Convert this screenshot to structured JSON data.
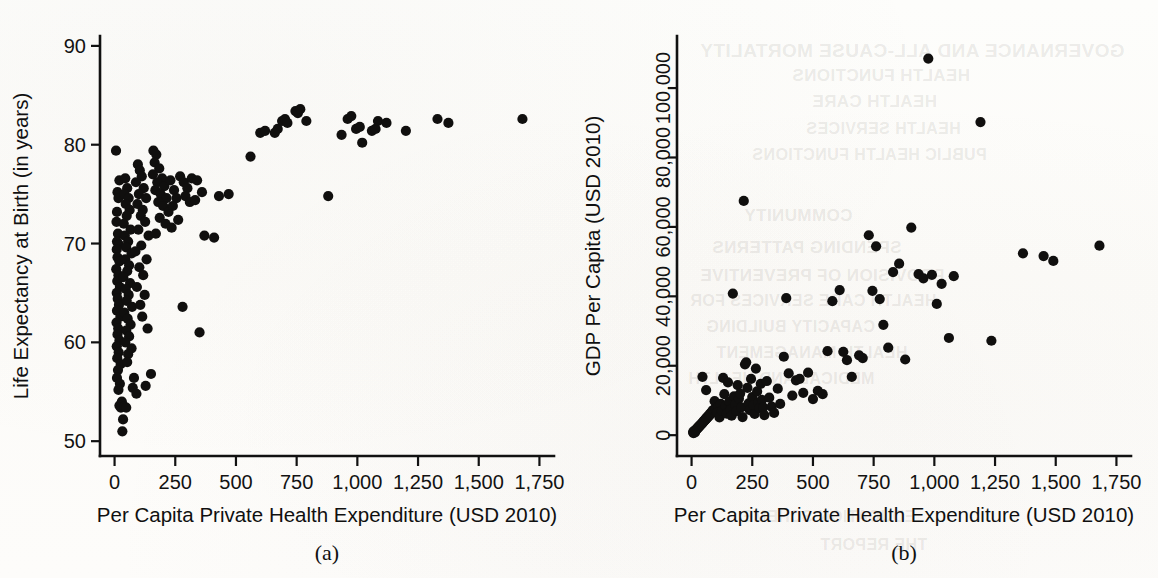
{
  "figure": {
    "background_color": "#fdfdfb",
    "ink_color": "#111111",
    "point_color": "#100f0e"
  },
  "panels": [
    {
      "id": "a",
      "caption": "(a)",
      "xlabel": "Per Capita Private Health Expenditure (USD 2010)",
      "ylabel": "Life Expectancy at Birth (in years)"
    },
    {
      "id": "b",
      "caption": "(b)",
      "xlabel": "Per Capita Private Health Expenditure (USD 2010)",
      "ylabel": "GDP Per Capita (USD 2010)"
    }
  ],
  "bleed_through_text": [
    "GOVERNANCE AND ALL-CAUSE MORTALITY",
    "HEALTH FUNCTIONS",
    "HEALTH CARE",
    "HEALTH SERVICES",
    "PUBLIC HEALTH FUNCTIONS",
    "COMMUNITY",
    "SPENDING PATTERNS",
    "PROVISION OF PREVENTIVE",
    "HEALTH CARE SERVICES FOR",
    "CAPACITY BUILDING",
    "HEALTH MANAGEMENT",
    "MEDICAL AND HEALTH",
    "EDUCATION SCHEME",
    "THE REPORT"
  ],
  "chart_data": [
    {
      "type": "scatter",
      "panel": "a",
      "title": "",
      "xlabel": "Per Capita Private Health Expenditure (USD 2010)",
      "ylabel": "Life Expectancy at Birth (in years)",
      "xlim": [
        -60,
        1810
      ],
      "ylim": [
        48.5,
        91
      ],
      "xticks": [
        0,
        250,
        500,
        750,
        1000,
        1250,
        1500,
        1750
      ],
      "xticklabels": [
        "0",
        "250",
        "500",
        "750",
        "1,000",
        "1,250",
        "1,500",
        "1,750"
      ],
      "yticks": [
        50,
        60,
        70,
        80,
        90
      ],
      "yticklabels": [
        "50",
        "60",
        "70",
        "80",
        "90"
      ],
      "grid": false,
      "legend": null,
      "marker": "filled-circle",
      "points": [
        [
          6,
          79.4
        ],
        [
          20,
          76.4
        ],
        [
          12,
          75.2
        ],
        [
          16,
          74.6
        ],
        [
          10,
          73.2
        ],
        [
          8,
          72.2
        ],
        [
          14,
          71.0
        ],
        [
          10,
          70.2
        ],
        [
          18,
          69.9
        ],
        [
          9,
          69.4
        ],
        [
          12,
          68.6
        ],
        [
          20,
          68.2
        ],
        [
          7,
          67.4
        ],
        [
          16,
          66.8
        ],
        [
          11,
          66.2
        ],
        [
          22,
          65.6
        ],
        [
          9,
          65.0
        ],
        [
          13,
          64.4
        ],
        [
          18,
          63.8
        ],
        [
          10,
          63.2
        ],
        [
          24,
          62.6
        ],
        [
          8,
          62.0
        ],
        [
          15,
          61.4
        ],
        [
          12,
          60.8
        ],
        [
          20,
          60.2
        ],
        [
          9,
          59.6
        ],
        [
          17,
          59.0
        ],
        [
          11,
          58.4
        ],
        [
          25,
          57.8
        ],
        [
          14,
          57.2
        ],
        [
          10,
          56.4
        ],
        [
          22,
          55.8
        ],
        [
          16,
          55.2
        ],
        [
          30,
          54.0
        ],
        [
          20,
          53.6
        ],
        [
          26,
          53.4
        ],
        [
          40,
          53.5
        ],
        [
          48,
          53.4
        ],
        [
          35,
          52.2
        ],
        [
          32,
          51.0
        ],
        [
          44,
          76.6
        ],
        [
          52,
          75.6
        ],
        [
          40,
          75.0
        ],
        [
          58,
          74.6
        ],
        [
          46,
          74.0
        ],
        [
          62,
          73.4
        ],
        [
          50,
          72.8
        ],
        [
          38,
          72.0
        ],
        [
          66,
          71.4
        ],
        [
          42,
          70.8
        ],
        [
          56,
          70.2
        ],
        [
          48,
          69.6
        ],
        [
          70,
          69.0
        ],
        [
          44,
          68.4
        ],
        [
          60,
          67.8
        ],
        [
          52,
          67.2
        ],
        [
          36,
          66.6
        ],
        [
          64,
          66.0
        ],
        [
          46,
          65.4
        ],
        [
          58,
          64.8
        ],
        [
          50,
          64.2
        ],
        [
          72,
          63.6
        ],
        [
          40,
          63.0
        ],
        [
          54,
          62.4
        ],
        [
          66,
          61.8
        ],
        [
          48,
          61.2
        ],
        [
          60,
          60.6
        ],
        [
          44,
          60.0
        ],
        [
          70,
          59.4
        ],
        [
          56,
          58.8
        ],
        [
          52,
          58.0
        ],
        [
          80,
          56.4
        ],
        [
          75,
          55.4
        ],
        [
          90,
          54.8
        ],
        [
          96,
          78.0
        ],
        [
          104,
          77.4
        ],
        [
          112,
          76.8
        ],
        [
          88,
          76.2
        ],
        [
          120,
          75.6
        ],
        [
          100,
          75.0
        ],
        [
          130,
          74.6
        ],
        [
          94,
          74.0
        ],
        [
          116,
          73.4
        ],
        [
          108,
          72.8
        ],
        [
          126,
          72.2
        ],
        [
          98,
          71.4
        ],
        [
          140,
          70.8
        ],
        [
          110,
          69.8
        ],
        [
          86,
          69.2
        ],
        [
          132,
          68.4
        ],
        [
          102,
          67.6
        ],
        [
          118,
          66.8
        ],
        [
          92,
          65.6
        ],
        [
          124,
          64.8
        ],
        [
          106,
          63.8
        ],
        [
          114,
          62.6
        ],
        [
          136,
          61.4
        ],
        [
          150,
          56.8
        ],
        [
          128,
          55.6
        ],
        [
          160,
          79.4
        ],
        [
          172,
          79.0
        ],
        [
          165,
          78.2
        ],
        [
          184,
          77.6
        ],
        [
          158,
          77.0
        ],
        [
          196,
          76.6
        ],
        [
          176,
          76.2
        ],
        [
          205,
          75.8
        ],
        [
          168,
          75.4
        ],
        [
          190,
          75.0
        ],
        [
          214,
          74.6
        ],
        [
          180,
          74.2
        ],
        [
          200,
          73.8
        ],
        [
          222,
          73.2
        ],
        [
          186,
          72.6
        ],
        [
          210,
          72.0
        ],
        [
          235,
          71.6
        ],
        [
          170,
          71.0
        ],
        [
          230,
          76.4
        ],
        [
          245,
          75.4
        ],
        [
          255,
          74.6
        ],
        [
          240,
          73.8
        ],
        [
          262,
          72.4
        ],
        [
          270,
          76.8
        ],
        [
          285,
          76.2
        ],
        [
          300,
          75.6
        ],
        [
          292,
          74.8
        ],
        [
          310,
          74.2
        ],
        [
          280,
          63.6
        ],
        [
          350,
          61.0
        ],
        [
          318,
          76.6
        ],
        [
          340,
          76.4
        ],
        [
          360,
          75.2
        ],
        [
          332,
          74.4
        ],
        [
          370,
          70.8
        ],
        [
          410,
          70.6
        ],
        [
          430,
          74.8
        ],
        [
          470,
          75.0
        ],
        [
          560,
          78.8
        ],
        [
          600,
          81.2
        ],
        [
          620,
          81.4
        ],
        [
          660,
          81.2
        ],
        [
          672,
          81.6
        ],
        [
          690,
          82.4
        ],
        [
          702,
          82.6
        ],
        [
          712,
          82.2
        ],
        [
          745,
          83.4
        ],
        [
          755,
          83.2
        ],
        [
          765,
          83.6
        ],
        [
          790,
          82.4
        ],
        [
          880,
          74.8
        ],
        [
          935,
          81.0
        ],
        [
          960,
          82.6
        ],
        [
          975,
          82.9
        ],
        [
          995,
          81.6
        ],
        [
          1010,
          81.8
        ],
        [
          1020,
          80.2
        ],
        [
          1060,
          81.4
        ],
        [
          1075,
          81.6
        ],
        [
          1085,
          82.4
        ],
        [
          1120,
          82.2
        ],
        [
          1200,
          81.4
        ],
        [
          1330,
          82.6
        ],
        [
          1375,
          82.2
        ],
        [
          1680,
          82.6
        ]
      ]
    },
    {
      "type": "scatter",
      "panel": "b",
      "title": "",
      "xlabel": "Per Capita Private Health Expenditure (USD 2010)",
      "ylabel": "GDP Per Capita (USD 2010)",
      "xlim": [
        -60,
        1810
      ],
      "ylim": [
        -6000,
        115000
      ],
      "xticks": [
        0,
        250,
        500,
        750,
        1000,
        1250,
        1500,
        1750
      ],
      "xticklabels": [
        "0",
        "250",
        "500",
        "750",
        "1,000",
        "1,250",
        "1,500",
        "1,750"
      ],
      "yticks": [
        0,
        20000,
        40000,
        60000,
        80000,
        100000
      ],
      "yticklabels": [
        "0",
        "20,000",
        "40,000",
        "60,000",
        "80,000",
        "100,000"
      ],
      "grid": false,
      "legend": null,
      "marker": "filled-circle",
      "points": [
        [
          6,
          900
        ],
        [
          10,
          1200
        ],
        [
          14,
          800
        ],
        [
          18,
          1500
        ],
        [
          8,
          600
        ],
        [
          22,
          1800
        ],
        [
          12,
          1000
        ],
        [
          26,
          2100
        ],
        [
          16,
          1400
        ],
        [
          30,
          2400
        ],
        [
          20,
          1700
        ],
        [
          34,
          2700
        ],
        [
          24,
          2000
        ],
        [
          38,
          3000
        ],
        [
          28,
          2300
        ],
        [
          42,
          3300
        ],
        [
          32,
          2600
        ],
        [
          46,
          3600
        ],
        [
          36,
          2900
        ],
        [
          50,
          4000
        ],
        [
          40,
          3200
        ],
        [
          54,
          4300
        ],
        [
          44,
          3500
        ],
        [
          58,
          4600
        ],
        [
          48,
          3800
        ],
        [
          62,
          5000
        ],
        [
          52,
          4100
        ],
        [
          66,
          5300
        ],
        [
          56,
          4400
        ],
        [
          70,
          5600
        ],
        [
          60,
          4700
        ],
        [
          74,
          6000
        ],
        [
          64,
          5000
        ],
        [
          78,
          6300
        ],
        [
          68,
          5300
        ],
        [
          82,
          6600
        ],
        [
          72,
          5600
        ],
        [
          86,
          7000
        ],
        [
          76,
          5900
        ],
        [
          90,
          7300
        ],
        [
          45,
          16800
        ],
        [
          60,
          13000
        ],
        [
          95,
          9800
        ],
        [
          100,
          7600
        ],
        [
          110,
          8200
        ],
        [
          105,
          6400
        ],
        [
          115,
          5100
        ],
        [
          120,
          9000
        ],
        [
          125,
          7000
        ],
        [
          130,
          16500
        ],
        [
          135,
          11800
        ],
        [
          140,
          8400
        ],
        [
          145,
          6200
        ],
        [
          150,
          15200
        ],
        [
          155,
          9600
        ],
        [
          160,
          7400
        ],
        [
          165,
          5600
        ],
        [
          170,
          40800
        ],
        [
          175,
          11200
        ],
        [
          180,
          8800
        ],
        [
          185,
          6900
        ],
        [
          190,
          14400
        ],
        [
          195,
          10500
        ],
        [
          200,
          12000
        ],
        [
          205,
          8000
        ],
        [
          210,
          5200
        ],
        [
          215,
          67500
        ],
        [
          220,
          20400
        ],
        [
          225,
          21000
        ],
        [
          230,
          13600
        ],
        [
          235,
          9200
        ],
        [
          240,
          7200
        ],
        [
          245,
          16200
        ],
        [
          250,
          11000
        ],
        [
          255,
          8600
        ],
        [
          260,
          6100
        ],
        [
          265,
          19200
        ],
        [
          270,
          12600
        ],
        [
          275,
          9400
        ],
        [
          280,
          7800
        ],
        [
          285,
          14800
        ],
        [
          290,
          10200
        ],
        [
          295,
          8000
        ],
        [
          300,
          5800
        ],
        [
          310,
          15600
        ],
        [
          320,
          10800
        ],
        [
          330,
          8200
        ],
        [
          340,
          6400
        ],
        [
          355,
          13400
        ],
        [
          365,
          9000
        ],
        [
          380,
          22600
        ],
        [
          390,
          39500
        ],
        [
          400,
          17800
        ],
        [
          415,
          11400
        ],
        [
          430,
          15800
        ],
        [
          445,
          16200
        ],
        [
          460,
          12200
        ],
        [
          480,
          18000
        ],
        [
          500,
          10400
        ],
        [
          520,
          12800
        ],
        [
          540,
          11800
        ],
        [
          560,
          24200
        ],
        [
          580,
          38600
        ],
        [
          610,
          41800
        ],
        [
          625,
          24000
        ],
        [
          640,
          21600
        ],
        [
          660,
          16800
        ],
        [
          690,
          23000
        ],
        [
          705,
          22200
        ],
        [
          730,
          57600
        ],
        [
          745,
          41600
        ],
        [
          760,
          54400
        ],
        [
          775,
          39200
        ],
        [
          790,
          31800
        ],
        [
          810,
          25200
        ],
        [
          830,
          47000
        ],
        [
          855,
          49400
        ],
        [
          880,
          21800
        ],
        [
          905,
          59800
        ],
        [
          935,
          46400
        ],
        [
          955,
          45200
        ],
        [
          975,
          108500
        ],
        [
          990,
          46200
        ],
        [
          1010,
          37800
        ],
        [
          1030,
          43600
        ],
        [
          1060,
          28000
        ],
        [
          1080,
          45800
        ],
        [
          1190,
          90200
        ],
        [
          1235,
          27200
        ],
        [
          1365,
          52400
        ],
        [
          1450,
          51600
        ],
        [
          1490,
          50200
        ],
        [
          1680,
          54600
        ]
      ]
    }
  ]
}
